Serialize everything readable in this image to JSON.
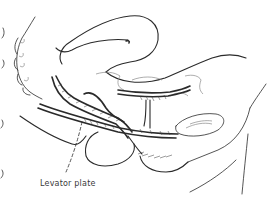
{
  "figure": {
    "type": "anatomical line drawing",
    "view": "sagittal section of pelvis",
    "labels": [
      {
        "text": "Levator plate",
        "x": 40,
        "y": 182
      }
    ],
    "colors": {
      "line": "#2a2a2a",
      "background": "#ffffff",
      "label": "#3a3a3a"
    }
  }
}
